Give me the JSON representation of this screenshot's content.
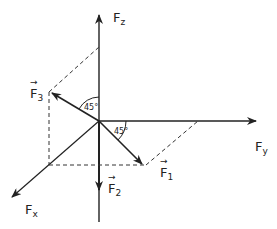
{
  "diagram": {
    "axes": {
      "z": {
        "label": "F",
        "sub": "z"
      },
      "y": {
        "label": "F",
        "sub": "y"
      },
      "x": {
        "label": "F",
        "sub": "x"
      }
    },
    "forces": [
      {
        "label": "F",
        "sub": "1"
      },
      {
        "label": "F",
        "sub": "2"
      },
      {
        "label": "F",
        "sub": "3"
      }
    ],
    "angles": [
      {
        "text": "45°",
        "between": "F3 and Fz"
      },
      {
        "text": "45°",
        "between": "F1 and Fy"
      }
    ],
    "colors": {
      "ink": "#222222",
      "background": "#ffffff"
    }
  }
}
